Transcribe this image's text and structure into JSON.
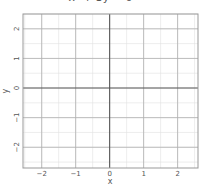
{
  "chart_data": {
    "type": "line",
    "title": "x² + 3y = 0",
    "xlabel": "x",
    "ylabel": "y",
    "xlim": [
      -2.55,
      2.6
    ],
    "ylim": [
      -2.7,
      2.5
    ],
    "xticks": [
      -2,
      -1,
      0,
      1,
      2
    ],
    "yticks": [
      -2,
      -1,
      0,
      1,
      2
    ],
    "xtick_labels": [
      "−2",
      "−1",
      "0",
      "1",
      "2"
    ],
    "ytick_labels": [
      "−2",
      "−1",
      "0",
      "1",
      "2"
    ],
    "grid": true,
    "minor_grid_step": 0.5,
    "series": [],
    "colors": {
      "grid_major": "#b0b0b0",
      "grid_minor": "#e0e0e0",
      "axis_zero": "#555555",
      "frame": "#999999"
    }
  }
}
